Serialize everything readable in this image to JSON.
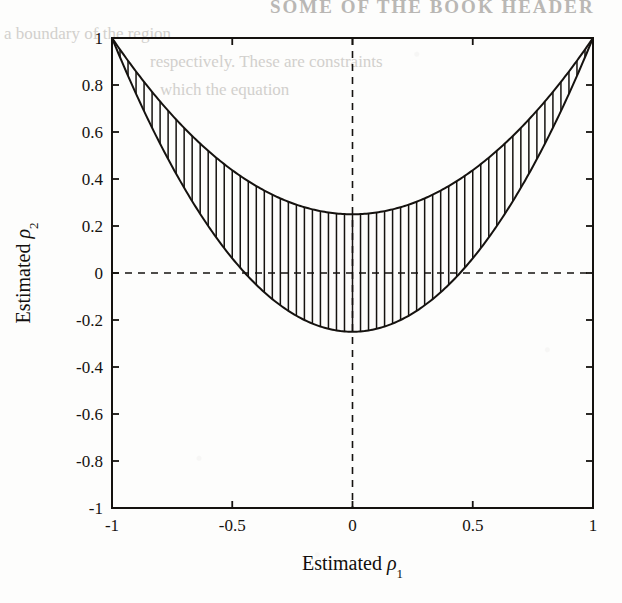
{
  "page": {
    "background_color": "#fdfdfc",
    "ink_color": "#15120f",
    "bleed_color": "#c9c7c4",
    "bleed_header": "SOME OF THE BOOK HEADER",
    "bleed_lines": [
      "a boundary of the region",
      "respectively. These are constraints",
      "which the  equation"
    ]
  },
  "chart_data": {
    "type": "area",
    "title": "",
    "xlabel": "Estimated",
    "xlabel_symbol": "ρ",
    "xlabel_subscript": "1",
    "ylabel": "Estimated",
    "ylabel_symbol": "ρ",
    "ylabel_subscript": "2",
    "xlim": [
      -1,
      1
    ],
    "ylim": [
      -1,
      1
    ],
    "grid": false,
    "legend": "none",
    "xticks": [
      -1,
      -0.5,
      0,
      0.5,
      1
    ],
    "xticklabels": [
      "-1",
      "-0.5",
      "0",
      "0.5",
      "1"
    ],
    "yticks": [
      -1,
      -0.8,
      -0.6,
      -0.4,
      -0.2,
      0,
      0.2,
      0.4,
      0.6,
      0.8,
      1
    ],
    "yticklabels": [
      "-1",
      "-0.8",
      "-0.6",
      "-0.4",
      "-0.2",
      "0",
      "0.2",
      "0.4",
      "0.6",
      "0.8",
      "1"
    ],
    "reference_lines": [
      {
        "name": "vertical-zero",
        "orientation": "vertical",
        "value": 0,
        "style": "dashed"
      },
      {
        "name": "horizontal-zero",
        "orientation": "horizontal",
        "value": 0,
        "style": "dashed"
      }
    ],
    "series": [
      {
        "name": "upper-boundary",
        "kind": "curve",
        "expression": "y = 0.75*x^2 + 0.25",
        "vertex": [
          0,
          0.25
        ],
        "endpoints": [
          [
            -1,
            1
          ],
          [
            1,
            1
          ]
        ],
        "x": [
          -1,
          -0.9,
          -0.8,
          -0.7,
          -0.6,
          -0.5,
          -0.4,
          -0.3,
          -0.2,
          -0.1,
          0,
          0.1,
          0.2,
          0.3,
          0.4,
          0.5,
          0.6,
          0.7,
          0.8,
          0.9,
          1
        ],
        "values": [
          1,
          0.858,
          0.73,
          0.618,
          0.52,
          0.438,
          0.37,
          0.318,
          0.28,
          0.258,
          0.25,
          0.258,
          0.28,
          0.318,
          0.37,
          0.438,
          0.52,
          0.618,
          0.73,
          0.858,
          1
        ]
      },
      {
        "name": "lower-boundary",
        "kind": "curve",
        "expression": "y = 1.25*x^2 - 0.25",
        "vertex": [
          0,
          -0.25
        ],
        "endpoints": [
          [
            -1,
            1
          ],
          [
            1,
            1
          ]
        ],
        "zero_crossings": [
          -0.447,
          0.447
        ],
        "x": [
          -1,
          -0.9,
          -0.8,
          -0.7,
          -0.6,
          -0.5,
          -0.4,
          -0.3,
          -0.2,
          -0.1,
          0,
          0.1,
          0.2,
          0.3,
          0.4,
          0.5,
          0.6,
          0.7,
          0.8,
          0.9,
          1
        ],
        "values": [
          1,
          0.7625,
          0.55,
          0.3625,
          0.2,
          0.0625,
          -0.05,
          -0.1375,
          -0.2,
          -0.2375,
          -0.25,
          -0.2375,
          -0.2,
          -0.1375,
          -0.05,
          0.0625,
          0.2,
          0.3625,
          0.55,
          0.7625,
          1
        ]
      }
    ],
    "fill": {
      "name": "feasible-region",
      "between": [
        "upper-boundary",
        "lower-boundary"
      ],
      "pattern": "vertical-hatch",
      "hatch_count": 60,
      "color": "#15120f"
    }
  }
}
